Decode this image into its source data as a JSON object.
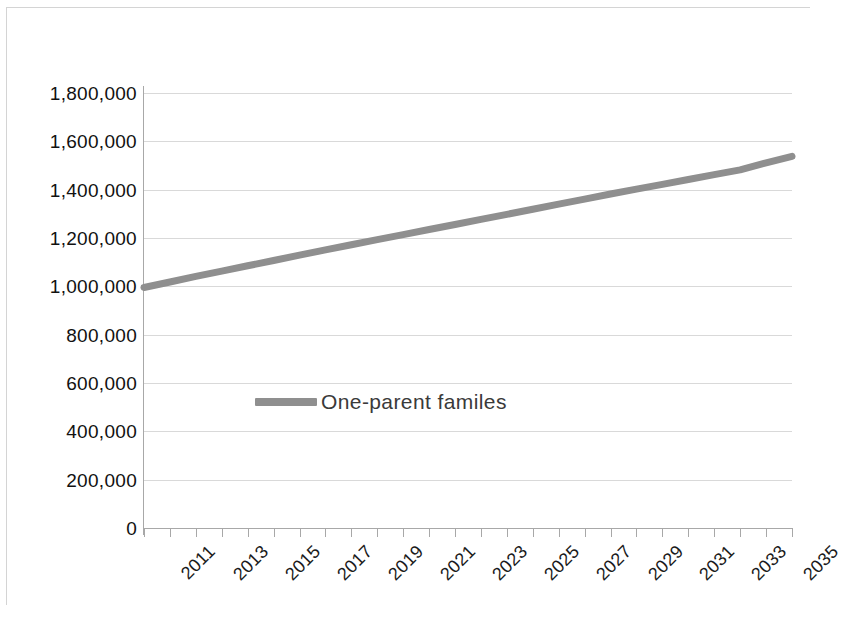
{
  "chart_data": {
    "type": "line",
    "title": "",
    "subtitle": "",
    "xlabel": "",
    "ylabel": "",
    "legend": {
      "position": "inside-center-left",
      "entries": [
        "One-parent familes"
      ]
    },
    "grid": "horizontal",
    "ylim": [
      0,
      1800000
    ],
    "y_ticks": [
      0,
      200000,
      400000,
      600000,
      800000,
      1000000,
      1200000,
      1400000,
      1600000,
      1800000
    ],
    "y_tick_labels": [
      "0",
      "200,000",
      "400,000",
      "600,000",
      "800,000",
      "1,000,000",
      "1,200,000",
      "1,400,000",
      "1,600,000",
      "1,800,000"
    ],
    "xlim": [
      2011,
      2036
    ],
    "x_tick_labels": [
      "2011",
      "2013",
      "2015",
      "2017",
      "2019",
      "2021",
      "2023",
      "2025",
      "2027",
      "2029",
      "2031",
      "2033",
      "2035"
    ],
    "x_all_years": [
      2011,
      2012,
      2013,
      2014,
      2015,
      2016,
      2017,
      2018,
      2019,
      2020,
      2021,
      2022,
      2023,
      2024,
      2025,
      2026,
      2027,
      2028,
      2029,
      2030,
      2031,
      2032,
      2033,
      2034,
      2035,
      2036
    ],
    "series": [
      {
        "name": "One-parent familes",
        "color": "#8f8f8f",
        "x": [
          2011,
          2012,
          2013,
          2014,
          2015,
          2016,
          2017,
          2018,
          2019,
          2020,
          2021,
          2022,
          2023,
          2024,
          2025,
          2026,
          2027,
          2028,
          2029,
          2030,
          2031,
          2032,
          2033,
          2034,
          2035,
          2036
        ],
        "values": [
          995000,
          1018000,
          1041000,
          1063000,
          1085000,
          1107000,
          1129000,
          1151000,
          1172000,
          1193000,
          1214000,
          1235000,
          1256000,
          1277000,
          1298000,
          1319000,
          1340000,
          1361000,
          1382000,
          1402000,
          1422000,
          1442000,
          1462000,
          1482000,
          1511000,
          1538000
        ]
      }
    ]
  },
  "colors": {
    "series": "#8f8f8f",
    "gridline": "#d9d9d9",
    "axis": "#a8a8a8",
    "frame": "#d4d4d4",
    "text": "#111111"
  }
}
